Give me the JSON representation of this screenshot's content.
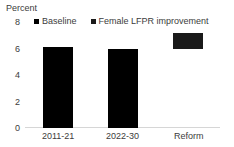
{
  "chart_data": {
    "type": "bar",
    "title": "",
    "subtitle": "",
    "xlabel": "",
    "ylabel": "Percent",
    "ylim": [
      0,
      8
    ],
    "yticks": [
      0,
      2,
      4,
      6,
      8
    ],
    "ytick_labels": [
      "0",
      "2",
      "4",
      "6",
      "8"
    ],
    "grid": false,
    "legend_position": "top",
    "categories": [
      "2011-21",
      "2022-30",
      "Reform"
    ],
    "series": [
      {
        "name": "Baseline",
        "color": "#000000",
        "values": [
          6.1,
          6.0,
          null
        ]
      },
      {
        "name": "Female LFPR improvement",
        "color": "#1a1a1a",
        "values": [
          null,
          null,
          1.2
        ],
        "note": "floating increment bar drawn from 6.0 to 7.2"
      }
    ],
    "bars": [
      {
        "category": "2011-21",
        "series": "Baseline",
        "base": 0,
        "top": 6.1,
        "color": "#000000"
      },
      {
        "category": "2022-30",
        "series": "Baseline",
        "base": 0,
        "top": 6.0,
        "color": "#000000"
      },
      {
        "category": "Reform",
        "series": "Female LFPR improvement",
        "base": 6.0,
        "top": 7.2,
        "color": "#1a1a1a"
      }
    ],
    "legend": [
      {
        "label": "Baseline",
        "color": "#000000"
      },
      {
        "label": "Female LFPR improvement",
        "color": "#1a1a1a"
      }
    ]
  },
  "axis": {
    "y_title": "Percent"
  },
  "colors": {
    "bar_black": "#000000",
    "bar_reform": "#1a1a1a",
    "axis_line": "#d6d6d6",
    "text": "#3c3c3c",
    "background": "#ffffff"
  }
}
